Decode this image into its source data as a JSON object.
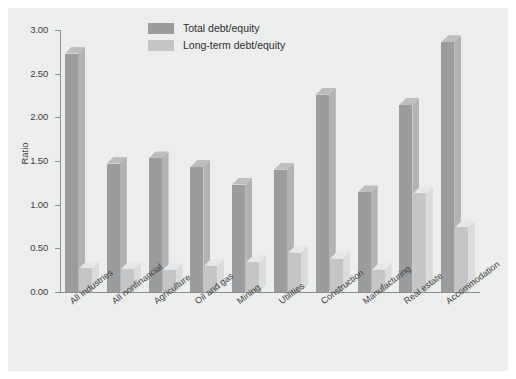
{
  "chart_data": {
    "type": "bar",
    "title": "",
    "xlabel": "",
    "ylabel": "Ratio",
    "ylim": [
      0,
      3.0
    ],
    "ytick_step": 0.5,
    "ytick_labels": [
      "0.00",
      "0.50",
      "1.00",
      "1.50",
      "2.00",
      "2.50",
      "3.00"
    ],
    "grid": false,
    "legend_position": "top-center",
    "style": "3d-grouped-bar",
    "categories": [
      "All industries",
      "All nonfinancial",
      "Agriculture",
      "Oil and gas",
      "Mining",
      "Utilities",
      "Construction",
      "Manufacturing",
      "Real estate",
      "Accommodation"
    ],
    "series": [
      {
        "name": "Total debt/equity",
        "color": "#9a9c9e",
        "values": [
          2.73,
          1.47,
          1.53,
          1.43,
          1.23,
          1.4,
          2.26,
          1.14,
          2.14,
          2.86
        ]
      },
      {
        "name": "Long-term debt/equity",
        "color": "#c3c5c6",
        "values": [
          0.27,
          0.26,
          0.25,
          0.3,
          0.34,
          0.45,
          0.38,
          0.25,
          1.13,
          0.74
        ]
      }
    ]
  },
  "legend": {
    "items": [
      {
        "label": "Total debt/equity",
        "swatch": "#9a9c9e"
      },
      {
        "label": "Long-term debt/equity",
        "swatch": "#c3c5c6"
      }
    ]
  },
  "axis": {
    "y_title": "Ratio"
  }
}
